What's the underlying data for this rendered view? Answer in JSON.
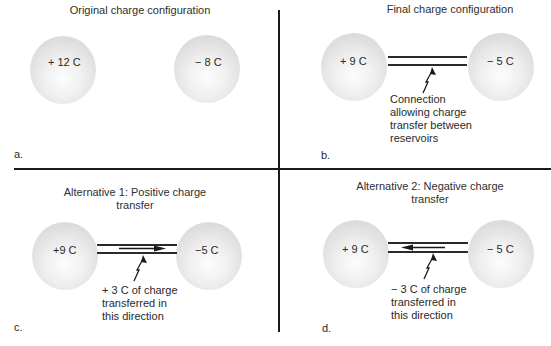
{
  "panels": {
    "a": {
      "letter": "a.",
      "title": "Original charge configuration",
      "left_sphere": "+ 12 C",
      "right_sphere": "− 8 C"
    },
    "b": {
      "letter": "b.",
      "title": "Final charge configuration",
      "left_sphere": "+ 9 C",
      "right_sphere": "− 5 C",
      "annotation": "Connection\nallowing charge\ntransfer between\nreservoirs"
    },
    "c": {
      "letter": "c.",
      "title": "Alternative 1: Positive charge\ntransfer",
      "left_sphere": "+9 C",
      "right_sphere": "−5 C",
      "arrow_direction": "right",
      "annotation": "+ 3 C of charge\ntransferred in\nthis direction"
    },
    "d": {
      "letter": "d.",
      "title": "Alternative 2: Negative charge\ntransfer",
      "left_sphere": "+ 9 C",
      "right_sphere": "− 5 C",
      "arrow_direction": "left",
      "annotation": "− 3 C of charge\ntransferred in\nthis direction"
    }
  },
  "colors": {
    "divider": "#1a1a1a",
    "sphere_edge": "#d2d2d2",
    "sphere_center": "#fdfdfd",
    "text": "#2a2a2a"
  }
}
